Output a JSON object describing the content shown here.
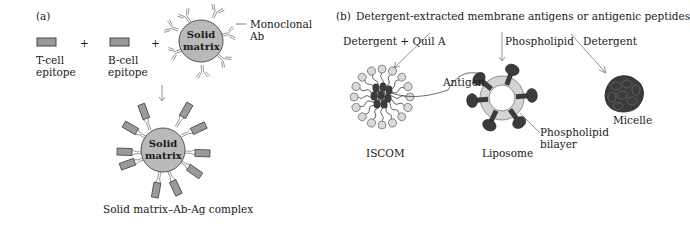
{
  "panel_a": {
    "label": "(a)",
    "t_cell": {
      "line1": "T-cell",
      "line2": "epitope"
    },
    "plus1": "+",
    "b_cell": {
      "line1": "B-cell",
      "line2": "epitope"
    },
    "plus2": "+",
    "matrix_top": {
      "line1": "Solid",
      "line2": "matrix"
    },
    "monoclonal": {
      "line1": "Monoclonal",
      "line2": "Ab"
    },
    "matrix_bottom": {
      "line1": "Solid",
      "line2": "matrix"
    },
    "complex_caption": "Solid matrix–Ab-Ag complex"
  },
  "panel_b": {
    "label": "(b)",
    "title": "Detergent-extracted membrane antigens or antigenic peptides",
    "path_iscom": "Detergent + Quil A",
    "path_liposome": "Phospholipid",
    "path_micelle": "Detergent",
    "antigen_label": "Antigen",
    "iscom_caption": "ISCOM",
    "liposome_caption": "Liposome",
    "bilayer_label": {
      "line1": "Phospholipid",
      "line2": "bilayer"
    },
    "micelle_caption": "Micelle"
  },
  "colors": {
    "matrix_fill": "#b9b9b9",
    "epitope_fill": "#9a9a9a",
    "dark_antigen": "#3b3b3b",
    "bilayer_fill": "#d4d4d4",
    "head_fill": "#d9d9d9",
    "line": "#555555"
  }
}
